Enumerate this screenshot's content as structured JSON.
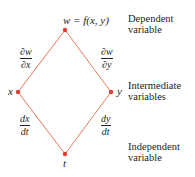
{
  "diagram": {
    "type": "tree",
    "colors": {
      "edge": "#e8775a",
      "node": "#e03c31",
      "text": "#231f20"
    },
    "nodes": [
      {
        "id": "w",
        "label": "w = f(x, y)",
        "x": 65,
        "y": 30
      },
      {
        "id": "x",
        "label": "x",
        "x": 18,
        "y": 92
      },
      {
        "id": "y",
        "label": "y",
        "x": 111,
        "y": 92
      },
      {
        "id": "t",
        "label": "t",
        "x": 65,
        "y": 154
      }
    ],
    "edges": [
      {
        "from": "w",
        "to": "x",
        "label_num": "∂w",
        "label_den": "∂x"
      },
      {
        "from": "w",
        "to": "y",
        "label_num": "∂w",
        "label_den": "∂y"
      },
      {
        "from": "x",
        "to": "t",
        "label_num": "dx",
        "label_den": "dt"
      },
      {
        "from": "y",
        "to": "t",
        "label_num": "dy",
        "label_den": "dt"
      }
    ],
    "annotations": {
      "dependent": [
        "Dependent",
        "variable"
      ],
      "intermediate": [
        "Intermediate",
        "variables"
      ],
      "independent": [
        "Independent",
        "variable"
      ]
    }
  }
}
